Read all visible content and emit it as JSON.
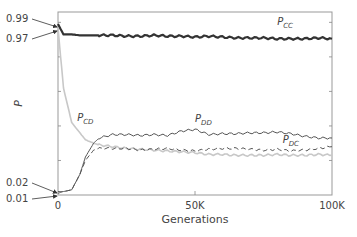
{
  "chart_data": {
    "type": "line",
    "title": "",
    "xlabel": "Generations",
    "ylabel": "P",
    "xlim": [
      0,
      100000
    ],
    "ylim": [
      0,
      1.06
    ],
    "grid": false,
    "x_tick_labels": [
      "0",
      "50K",
      "100K"
    ],
    "y_annotations": [
      {
        "label": "0.99",
        "value": 0.99,
        "series": "P_CC"
      },
      {
        "label": "0.97",
        "value": 0.97,
        "series": "P_CC"
      },
      {
        "label": "0.02",
        "value": 0.02,
        "series": "P_DD"
      },
      {
        "label": "0.01",
        "value": 0.01,
        "series": "P_DC"
      }
    ],
    "x": [
      0,
      2000,
      5000,
      8000,
      10000,
      13000,
      15000,
      20000,
      25000,
      30000,
      35000,
      40000,
      45000,
      50000,
      55000,
      60000,
      65000,
      70000,
      75000,
      80000,
      85000,
      90000,
      95000,
      100000
    ],
    "series": [
      {
        "name": "P_CC",
        "label_main": "P",
        "label_sub": "CC",
        "color": "#333333",
        "style": "solid",
        "width": 2.2,
        "values": [
          0.99,
          0.93,
          0.93,
          0.925,
          0.925,
          0.925,
          0.925,
          0.925,
          0.92,
          0.92,
          0.925,
          0.92,
          0.92,
          0.915,
          0.92,
          0.915,
          0.91,
          0.91,
          0.91,
          0.905,
          0.905,
          0.905,
          0.91,
          0.905
        ]
      },
      {
        "name": "P_CD",
        "label_main": "P",
        "label_sub": "CD",
        "color": "#c8c8c8",
        "style": "solid",
        "width": 1.6,
        "values": [
          0.97,
          0.62,
          0.42,
          0.36,
          0.32,
          0.3,
          0.29,
          0.28,
          0.27,
          0.265,
          0.26,
          0.255,
          0.25,
          0.245,
          0.235,
          0.235,
          0.23,
          0.23,
          0.23,
          0.235,
          0.23,
          0.23,
          0.235,
          0.23
        ]
      },
      {
        "name": "P_DD",
        "label_main": "P",
        "label_sub": "DD",
        "color": "#555555",
        "style": "solid",
        "width": 1.0,
        "values": [
          0.02,
          0.02,
          0.03,
          0.12,
          0.22,
          0.3,
          0.33,
          0.35,
          0.35,
          0.345,
          0.35,
          0.345,
          0.37,
          0.38,
          0.35,
          0.355,
          0.355,
          0.36,
          0.36,
          0.365,
          0.355,
          0.34,
          0.33,
          0.33
        ]
      },
      {
        "name": "P_DC",
        "label_main": "P",
        "label_sub": "DC",
        "color": "#555555",
        "style": "dashed",
        "width": 1.0,
        "values": [
          0.01,
          0.02,
          0.03,
          0.12,
          0.2,
          0.26,
          0.27,
          0.27,
          0.27,
          0.26,
          0.265,
          0.27,
          0.26,
          0.255,
          0.265,
          0.27,
          0.27,
          0.265,
          0.26,
          0.265,
          0.255,
          0.26,
          0.27,
          0.28
        ]
      }
    ],
    "series_label_positions": [
      {
        "name": "P_CC",
        "x": 80000,
        "y": 0.985
      },
      {
        "name": "P_CD",
        "x": 7000,
        "y": 0.43
      },
      {
        "name": "P_DD",
        "x": 50000,
        "y": 0.42
      },
      {
        "name": "P_DC",
        "x": 82000,
        "y": 0.3
      }
    ],
    "legend": "inline labels"
  }
}
